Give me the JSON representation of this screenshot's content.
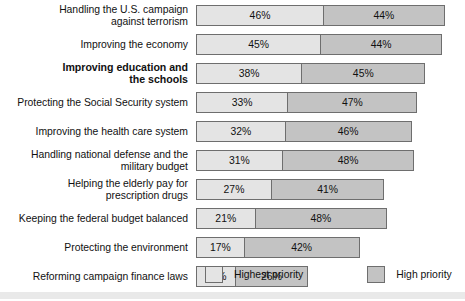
{
  "chart_data": {
    "type": "bar",
    "title": "",
    "subtitle": "",
    "xlabel": "",
    "ylabel": "",
    "orientation": "horizontal",
    "stacked": true,
    "grid": false,
    "xlim": [
      0,
      100
    ],
    "value_suffix": "%",
    "legend_position": "bottom",
    "categories": [
      "Handling the U.S. campaign\nagainst terrorism",
      "Improving the economy",
      "Improving education and\nthe schools",
      "Protecting the Social Security system",
      "Improving the health care system",
      "Handling national defense and the\nmilitary budget",
      "Helping the elderly pay for\nprescription drugs",
      "Keeping the federal budget balanced",
      "Protecting the environment",
      "Reforming campaign finance laws"
    ],
    "series": [
      {
        "name": "Highest priority",
        "color": "#e4e4e4",
        "values": [
          46,
          45,
          38,
          33,
          32,
          31,
          27,
          21,
          17,
          14
        ]
      },
      {
        "name": "High priority",
        "color": "#c3c3c3",
        "values": [
          44,
          44,
          45,
          47,
          46,
          48,
          41,
          48,
          42,
          26
        ]
      }
    ],
    "totals": [
      90,
      89,
      83,
      80,
      78,
      79,
      68,
      69,
      59,
      40
    ]
  },
  "rows": [
    {
      "label": "Handling the U.S. campaign\nagainst terrorism",
      "bold": false,
      "highest": "46%",
      "high": "44%",
      "highest_value": 46,
      "high_value": 44
    },
    {
      "label": "Improving the economy",
      "bold": false,
      "highest": "45%",
      "high": "44%",
      "highest_value": 45,
      "high_value": 44
    },
    {
      "label": "Improving education and\nthe schools",
      "bold": true,
      "highest": "38%",
      "high": "45%",
      "highest_value": 38,
      "high_value": 45
    },
    {
      "label": "Protecting the Social Security system",
      "bold": false,
      "highest": "33%",
      "high": "47%",
      "highest_value": 33,
      "high_value": 47
    },
    {
      "label": "Improving the health care system",
      "bold": false,
      "highest": "32%",
      "high": "46%",
      "highest_value": 32,
      "high_value": 46
    },
    {
      "label": "Handling national defense and the\nmilitary budget",
      "bold": false,
      "highest": "31%",
      "high": "48%",
      "highest_value": 31,
      "high_value": 48
    },
    {
      "label": "Helping the elderly pay for\nprescription drugs",
      "bold": false,
      "highest": "27%",
      "high": "41%",
      "highest_value": 27,
      "high_value": 41
    },
    {
      "label": "Keeping the federal budget balanced",
      "bold": false,
      "highest": "21%",
      "high": "48%",
      "highest_value": 21,
      "high_value": 48
    },
    {
      "label": "Protecting the environment",
      "bold": false,
      "highest": "17%",
      "high": "42%",
      "highest_value": 17,
      "high_value": 42
    },
    {
      "label": "Reforming campaign finance laws",
      "bold": false,
      "highest": "14%",
      "high": "26%",
      "highest_value": 14,
      "high_value": 26
    }
  ],
  "legend": {
    "highest_label": "Highest priority",
    "high_label": "High priority",
    "highest_color": "#e4e4e4",
    "high_color": "#c3c3c3"
  },
  "layout": {
    "bar_origin_x": 205,
    "px_per_percent": 2.74,
    "row_height": 29,
    "first_row_top": 1,
    "bar_height": 21
  }
}
